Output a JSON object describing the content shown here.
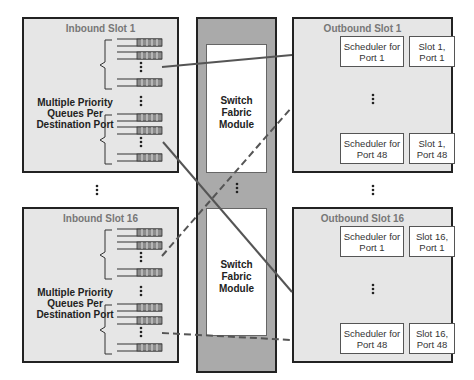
{
  "inbound": [
    {
      "title": "Inbound Slot 1",
      "queue_label": "Multiple Priority Queues Per Destination Port",
      "queue_label_lines": [
        "Multiple Priority",
        "Queues Per",
        "Destination Port"
      ]
    },
    {
      "title": "Inbound Slot 16",
      "queue_label": "Multiple Priority Queues Per Destination Port",
      "queue_label_lines": [
        "Multiple Priority",
        "Queues Per",
        "Destination Port"
      ]
    }
  ],
  "fabric": [
    {
      "label_lines": [
        "Switch",
        "Fabric",
        "Module"
      ]
    },
    {
      "label_lines": [
        "Switch",
        "Fabric",
        "Module"
      ]
    }
  ],
  "outbound": [
    {
      "title": "Outbound Slot 1",
      "rows": [
        {
          "scheduler": [
            "Scheduler for",
            "Port 1"
          ],
          "port": [
            "Slot 1,",
            "Port 1"
          ]
        },
        {
          "scheduler": [
            "Scheduler for",
            "Port 48"
          ],
          "port": [
            "Slot 1,",
            "Port 48"
          ]
        }
      ]
    },
    {
      "title": "Outbound Slot 16",
      "rows": [
        {
          "scheduler": [
            "Scheduler for",
            "Port 1"
          ],
          "port": [
            "Slot 16,",
            "Port 1"
          ]
        },
        {
          "scheduler": [
            "Scheduler for",
            "Port 48"
          ],
          "port": [
            "Slot 16,",
            "Port 48"
          ]
        }
      ]
    }
  ],
  "connections": [
    {
      "from": "Inbound Slot 1 / port 1 queues",
      "to": "Outbound Slot 1 / Port 1",
      "style": "solid"
    },
    {
      "from": "Inbound Slot 1 / port 48 queues",
      "to": "Outbound Slot 16 / Port 1",
      "style": "solid"
    },
    {
      "from": "Inbound Slot 16 / port 1 queues",
      "to": "Outbound Slot 1 / Port 48",
      "style": "dashed"
    },
    {
      "from": "Inbound Slot 16 / port 48 queues",
      "to": "Outbound Slot 16 / Port 48",
      "style": "dashed"
    }
  ],
  "colors": {
    "slot_bg": "#e6e6e6",
    "fabric_bg": "#aaaaaa",
    "line": "#555555",
    "queue_fill": "#8c8c8c"
  }
}
